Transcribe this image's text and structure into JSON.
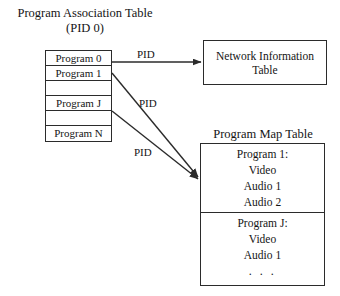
{
  "diagram": {
    "program_association_table": {
      "title_line1": "Program Association Table",
      "title_line2": "(PID 0)",
      "rows": [
        {
          "label": "Program 0",
          "blank": false
        },
        {
          "label": "Program 1",
          "blank": false
        },
        {
          "label": "",
          "blank": true
        },
        {
          "label": "Program J",
          "blank": false
        },
        {
          "label": "",
          "blank": true
        },
        {
          "label": "Program N",
          "blank": false
        }
      ]
    },
    "network_information_table": {
      "line1": "Network Information",
      "line2": "Table"
    },
    "program_map_table": {
      "title": "Program Map Table",
      "sections": [
        {
          "lines": [
            "Program 1:",
            "Video",
            "Audio 1",
            "Audio 2"
          ]
        },
        {
          "lines": [
            "Program J:",
            "Video",
            "Audio 1",
            ". . ."
          ]
        }
      ]
    },
    "edge_labels": [
      {
        "text": "PID"
      },
      {
        "text": "PID"
      },
      {
        "text": "PID"
      }
    ]
  }
}
